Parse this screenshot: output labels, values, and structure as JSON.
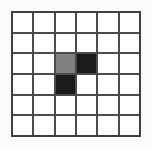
{
  "figure": {
    "name": "pixel-grid",
    "rows": 6,
    "columns": 6,
    "background_color": "#fbfbfb",
    "gridline_color": "#4a4a4a",
    "border_color": "#3f3f3f",
    "empty_cell_color": "#fdfdfd",
    "gray_cell_color": "#808080",
    "dark_cell_color": "#1a1a1a"
  },
  "chart_data": {
    "type": "heatmap",
    "title": "",
    "xlabel": "",
    "ylabel": "",
    "categories": [
      "1",
      "2",
      "3",
      "4",
      "5",
      "6"
    ],
    "row_labels": [
      "1",
      "2",
      "3",
      "4",
      "5",
      "6"
    ],
    "grid": true,
    "legend": "none",
    "value_colors": {
      "empty": "#fdfdfd",
      "gray": "#808080",
      "dark": "#1a1a1a"
    },
    "cells": [
      [
        "empty",
        "empty",
        "empty",
        "empty",
        "empty",
        "empty"
      ],
      [
        "empty",
        "empty",
        "empty",
        "empty",
        "empty",
        "empty"
      ],
      [
        "empty",
        "empty",
        "gray",
        "dark",
        "empty",
        "empty"
      ],
      [
        "empty",
        "empty",
        "dark",
        "empty",
        "empty",
        "empty"
      ],
      [
        "empty",
        "empty",
        "empty",
        "empty",
        "empty",
        "empty"
      ],
      [
        "empty",
        "empty",
        "empty",
        "empty",
        "empty",
        "empty"
      ]
    ],
    "values": [
      [
        0,
        0,
        0,
        0,
        0,
        0
      ],
      [
        0,
        0,
        0,
        0,
        0,
        0
      ],
      [
        0,
        0,
        1,
        2,
        0,
        0
      ],
      [
        0,
        0,
        2,
        0,
        0,
        0
      ],
      [
        0,
        0,
        0,
        0,
        0,
        0
      ],
      [
        0,
        0,
        0,
        0,
        0,
        0
      ]
    ]
  }
}
